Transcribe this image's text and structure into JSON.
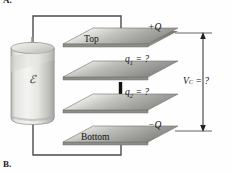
{
  "figure": {
    "part_label_top": "A.",
    "part_label_bottom": "B.",
    "title_semantic": "series-capacitor-circuit-with-battery"
  },
  "battery": {
    "symbol": "ℰ",
    "name": "battery-cell"
  },
  "plates": [
    {
      "id": "top",
      "name_label": "Top",
      "charge_label": "+Q",
      "charge_symbol": "+Q"
    },
    {
      "id": "plate1",
      "name_label": "",
      "charge_label": "q1 = ?",
      "q_symbol": "q",
      "q_index": "1",
      "q_value": "= ?"
    },
    {
      "id": "plate2",
      "name_label": "",
      "charge_label": "q2 = ?",
      "q_symbol": "q",
      "q_index": "2",
      "q_value": "= ?"
    },
    {
      "id": "bottom",
      "name_label": "Bottom",
      "charge_label": "−Q",
      "charge_symbol": "−Q"
    }
  ],
  "measurement": {
    "symbol": "V",
    "subscript": "C",
    "equals": "= ?",
    "full_label": "V_C = ?",
    "name": "capacitor-voltage-annotation"
  },
  "colors": {
    "plate_light": "#e8e8e6",
    "plate_mid": "#b9b9b6",
    "plate_dark": "#8f8f8c",
    "plate_edge": "#6e6e6b",
    "battery_light": "#f2f2ef",
    "battery_mid": "#d5d5d1",
    "battery_shadow": "#a9a9a5",
    "wire": "#4a4a4a",
    "ink": "#121212",
    "background": "#fefefe"
  }
}
